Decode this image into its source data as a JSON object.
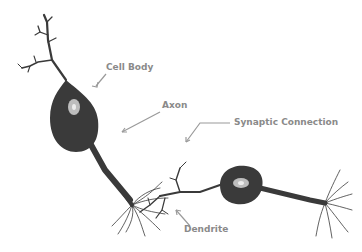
{
  "diagram": {
    "labels": {
      "cell_body": "Cell Body",
      "axon": "Axon",
      "synaptic_connection": "Synaptic Connection",
      "dendrite": "Dendrite"
    },
    "colors": {
      "neuron": "#3a3a3a",
      "nucleus": "#bdbdbd",
      "label": "#8a8a8a",
      "pointer": "#9a9a9a"
    }
  }
}
